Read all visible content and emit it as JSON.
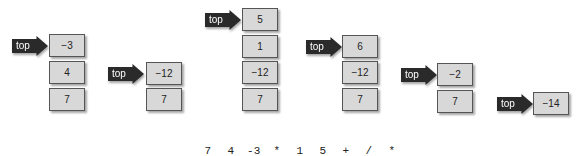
{
  "diagram": {
    "pointer_label": "top",
    "stacks": [
      {
        "items": [
          "−3",
          "4",
          "7"
        ]
      },
      {
        "items": [
          "−12",
          "7"
        ]
      },
      {
        "items": [
          "5",
          "1",
          "−12",
          "7"
        ]
      },
      {
        "items": [
          "6",
          "−12",
          "7"
        ]
      },
      {
        "items": [
          "−2",
          "7"
        ]
      },
      {
        "items": [
          "−14"
        ]
      }
    ],
    "expression": [
      "7",
      "4",
      "-3",
      "*",
      "1",
      "5",
      "+",
      "/",
      "*"
    ]
  }
}
